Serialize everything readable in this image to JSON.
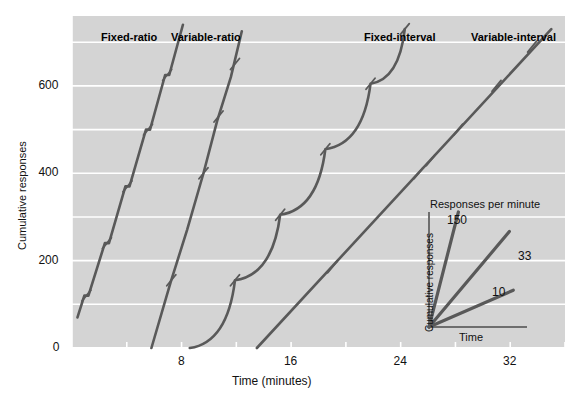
{
  "chart_data": {
    "type": "line",
    "title": "",
    "xlabel": "Time (minutes)",
    "ylabel": "Cumulative responses",
    "xlim": [
      0,
      36
    ],
    "ylim": [
      0,
      760
    ],
    "xticks": [
      8,
      16,
      24,
      32
    ],
    "xtick_labels": [
      "8",
      "16",
      "24",
      "32"
    ],
    "xminor_ticks": [
      4,
      12,
      20,
      28,
      36
    ],
    "yticks": [
      0,
      200,
      400,
      600
    ],
    "ytick_labels": [
      "0",
      "200",
      "400",
      "600"
    ],
    "gridlines_y": [
      100,
      200,
      300,
      400,
      500,
      600,
      700
    ],
    "grid": true,
    "grid_color": "#ffffff",
    "plot_background": "#d4d4d4",
    "page_background": "#ffffff",
    "line_color": "#595959",
    "legend_position": "above-curves",
    "series": [
      {
        "name": "Fixed-ratio",
        "label": "Fixed-ratio",
        "label_x": 101,
        "label_y": 31,
        "description": "steep constant high rate with brief post-reinforcement pauses; tick marks indicate reinforcers",
        "points": [
          [
            0.4,
            70
          ],
          [
            0.9,
            120
          ],
          [
            1.2,
            120
          ],
          [
            2.4,
            240
          ],
          [
            2.7,
            240
          ],
          [
            3.9,
            370
          ],
          [
            4.2,
            370
          ],
          [
            5.4,
            500
          ],
          [
            5.7,
            500
          ],
          [
            6.8,
            625
          ],
          [
            7.1,
            625
          ],
          [
            8.1,
            740
          ]
        ],
        "reinforcer_ticks": [
          [
            1.05,
            120
          ],
          [
            2.55,
            240
          ],
          [
            4.05,
            370
          ],
          [
            5.55,
            500
          ],
          [
            6.95,
            625
          ]
        ]
      },
      {
        "name": "Variable-ratio",
        "label": "Variable-ratio",
        "label_x": 171,
        "label_y": 31,
        "description": "steady very high rate, no pauses, reinforcers delivered unpredictably",
        "points": [
          [
            5.8,
            0
          ],
          [
            7.2,
            150
          ],
          [
            8.4,
            270
          ],
          [
            9.6,
            400
          ],
          [
            10.6,
            520
          ],
          [
            11.6,
            620
          ],
          [
            12.4,
            725
          ]
        ],
        "reinforcer_ticks": [
          [
            7.25,
            155
          ],
          [
            9.6,
            400
          ],
          [
            10.7,
            530
          ],
          [
            11.9,
            650
          ]
        ]
      },
      {
        "name": "Fixed-interval",
        "label": "Fixed-interval",
        "label_x": 364,
        "label_y": 31,
        "description": "scalloped pattern: post-reinforcement pause then accelerating responding before each reinforcer",
        "scallops": [
          {
            "start": [
              8.6,
              0
            ],
            "reinforcer": [
              11.9,
              155
            ]
          },
          {
            "start": [
              11.9,
              155
            ],
            "reinforcer": [
              15.2,
              305
            ]
          },
          {
            "start": [
              15.2,
              305
            ],
            "reinforcer": [
              18.5,
              455
            ]
          },
          {
            "start": [
              18.5,
              455
            ],
            "reinforcer": [
              21.8,
              605
            ]
          },
          {
            "start": [
              21.8,
              605
            ],
            "reinforcer": [
              24.3,
              730
            ]
          }
        ],
        "reinforcer_ticks": [
          [
            11.9,
            155
          ],
          [
            15.2,
            305
          ],
          [
            18.5,
            455
          ],
          [
            21.8,
            605
          ],
          [
            24.3,
            730
          ]
        ]
      },
      {
        "name": "Variable-interval",
        "label": "Variable-interval",
        "label_x": 471,
        "label_y": 31,
        "description": "steady moderate rate, straight line, reinforcers at unpredictable times",
        "points": [
          [
            13.5,
            0
          ],
          [
            35.0,
            730
          ]
        ],
        "reinforcer_ticks": [
          [
            19.0,
            185
          ],
          [
            25.3,
            400
          ],
          [
            26.2,
            430
          ],
          [
            28.2,
            500
          ],
          [
            31.0,
            600
          ],
          [
            33.6,
            690
          ]
        ]
      }
    ],
    "inset": {
      "title": "Responses per minute",
      "xlabel": "Time",
      "ylabel": "Cumulative responses",
      "type": "line",
      "rays": [
        {
          "label": "150",
          "slope_value": 150,
          "end_x": 0.3,
          "end_y": 1.0,
          "label_x": 447,
          "label_y": 213
        },
        {
          "label": "33",
          "slope_value": 33,
          "end_x": 0.82,
          "end_y": 0.83,
          "label_x": 518,
          "label_y": 249
        },
        {
          "label": "10",
          "slope_value": 10,
          "end_x": 0.86,
          "end_y": 0.32,
          "label_x": 492,
          "label_y": 285
        }
      ]
    }
  }
}
